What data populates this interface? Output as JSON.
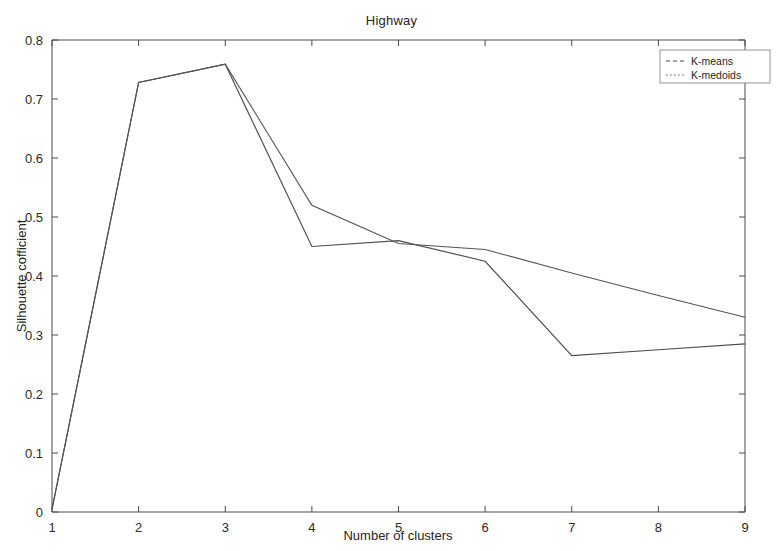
{
  "chart_data": {
    "type": "line",
    "title": "Highway",
    "xlabel": "Number of clusters",
    "ylabel": "Silhouette cofficient",
    "x": [
      1,
      2,
      3,
      4,
      5,
      6,
      7,
      8,
      9
    ],
    "xlim": [
      1,
      9
    ],
    "ylim": [
      0,
      0.8
    ],
    "xticks": [
      "1",
      "2",
      "3",
      "4",
      "5",
      "6",
      "7",
      "8",
      "9"
    ],
    "yticks": [
      "0",
      "0.1",
      "0.2",
      "0.3",
      "0.4",
      "0.5",
      "0.6",
      "0.7",
      "0.8"
    ],
    "grid": false,
    "legend_position": "top-right",
    "series": [
      {
        "name": "K-means",
        "color": "#4d4d4d",
        "values": [
          0.005,
          0.728,
          0.759,
          0.45,
          0.46,
          0.425,
          0.265,
          0.275,
          0.285
        ]
      },
      {
        "name": "K-medoids",
        "color": "#555555",
        "values": [
          0.005,
          0.728,
          0.759,
          0.52,
          0.455,
          0.445,
          0.405,
          0.367,
          0.33
        ]
      }
    ]
  },
  "legend": {
    "entries": [
      {
        "label": "K-means"
      },
      {
        "label": "K-medoids"
      }
    ]
  }
}
